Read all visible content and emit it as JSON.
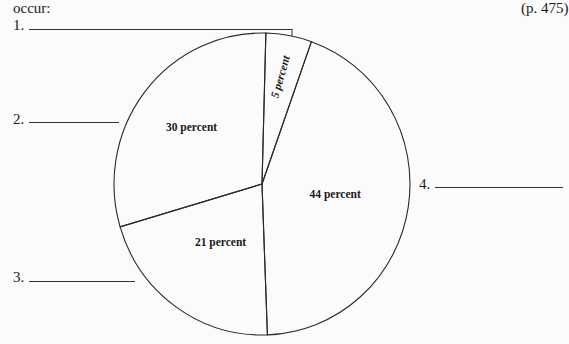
{
  "header": {
    "intro_fragment": "occur:",
    "page_ref": "(p. 475)"
  },
  "answer_blanks": [
    {
      "number": "1."
    },
    {
      "number": "2."
    },
    {
      "number": "3."
    },
    {
      "number": "4."
    }
  ],
  "chart_data": {
    "type": "pie",
    "title": "",
    "start_angle_deg": 0,
    "direction": "clockwise",
    "slices": [
      {
        "label": "5 percent",
        "value": 5,
        "blank": "1."
      },
      {
        "label": "44 percent",
        "value": 44,
        "blank": "4."
      },
      {
        "label": "21 percent",
        "value": 21,
        "blank": "3."
      },
      {
        "label": "30 percent",
        "value": 30,
        "blank": "2."
      }
    ],
    "legend": "none"
  }
}
